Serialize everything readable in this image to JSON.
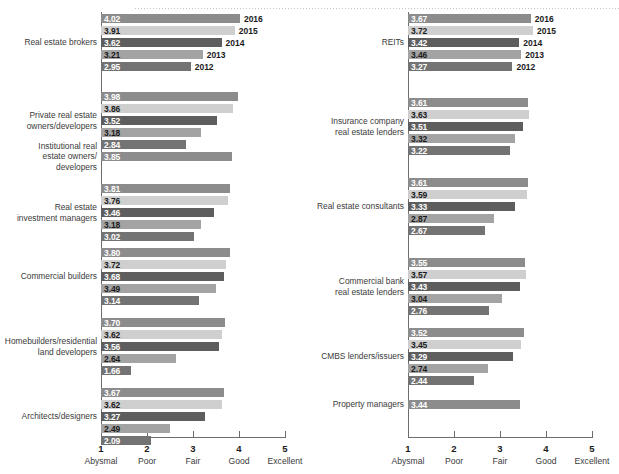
{
  "chart_data": {
    "type": "bar",
    "orientation": "horizontal",
    "title": "",
    "subtitle": "",
    "xlabel": "",
    "ylabel": "",
    "xlim": [
      1,
      5
    ],
    "grid": false,
    "legend_position": "inline-right-of-first-group",
    "axis": {
      "tick_values": [
        1,
        2,
        3,
        4,
        5
      ],
      "tick_labels": [
        "1",
        "2",
        "3",
        "4",
        "5"
      ],
      "tick_words": [
        "Abysmal",
        "Poor",
        "Fair",
        "Good",
        "Excellent"
      ]
    },
    "series": [
      {
        "name": "2016",
        "color": "#8c8c8c",
        "text_on": "dark"
      },
      {
        "name": "2015",
        "color": "#cfcfcf",
        "text_on": "light"
      },
      {
        "name": "2014",
        "color": "#5e5e5e",
        "text_on": "dark"
      },
      {
        "name": "2013",
        "color": "#a3a3a3",
        "text_on": "light"
      },
      {
        "name": "2012",
        "color": "#737373",
        "text_on": "dark"
      }
    ],
    "panels": [
      {
        "id": "left",
        "groups": [
          {
            "label": "Real estate brokers",
            "values": [
              4.02,
              3.91,
              3.62,
              3.21,
              2.95
            ],
            "value_labels": [
              "4.02",
              "3.91",
              "3.62",
              "3.21",
              "2.95"
            ],
            "show_year_labels": true
          },
          {
            "label": "Private real estate\nowners/developers",
            "values": [
              3.98,
              3.86,
              3.52,
              3.18,
              2.84
            ],
            "value_labels": [
              "3.98",
              "3.86",
              "3.52",
              "3.18",
              "2.84"
            ],
            "show_year_labels": false
          },
          {
            "label": "Institutional real\nestate owners/\ndevelopers",
            "values": [
              3.85
            ],
            "value_labels": [
              "3.85"
            ],
            "show_year_labels": false
          },
          {
            "label": "Real estate\ninvestment managers",
            "values": [
              3.81,
              3.76,
              3.46,
              3.18,
              3.02
            ],
            "value_labels": [
              "3.81",
              "3.76",
              "3.46",
              "3.18",
              "3.02"
            ],
            "show_year_labels": false
          },
          {
            "label": "Commercial builders",
            "values": [
              3.8,
              3.72,
              3.68,
              3.49,
              3.14
            ],
            "value_labels": [
              "3.80",
              "3.72",
              "3.68",
              "3.49",
              "3.14"
            ],
            "show_year_labels": false
          },
          {
            "label": "Homebuilders/residential\nland developers",
            "values": [
              3.7,
              3.62,
              3.56,
              2.64,
              1.66
            ],
            "value_labels": [
              "3.70",
              "3.62",
              "3.56",
              "2.64",
              "1.66"
            ],
            "show_year_labels": false
          },
          {
            "label": "Architects/designers",
            "values": [
              3.67,
              3.62,
              3.27,
              2.49,
              2.09
            ],
            "value_labels": [
              "3.67",
              "3.62",
              "3.27",
              "2.49",
              "2.09"
            ],
            "show_year_labels": false
          }
        ]
      },
      {
        "id": "right",
        "groups": [
          {
            "label": "REITs",
            "values": [
              3.67,
              3.72,
              3.42,
              3.46,
              3.27
            ],
            "value_labels": [
              "3.67",
              "3.72",
              "3.42",
              "3.46",
              "3.27"
            ],
            "show_year_labels": true
          },
          {
            "label": "Insurance company\nreal estate lenders",
            "values": [
              3.61,
              3.63,
              3.51,
              3.32,
              3.22
            ],
            "value_labels": [
              "3.61",
              "3.63",
              "3.51",
              "3.32",
              "3.22"
            ],
            "show_year_labels": false
          },
          {
            "label": "Real estate consultants",
            "values": [
              3.61,
              3.59,
              3.33,
              2.87,
              2.67
            ],
            "value_labels": [
              "3.61",
              "3.59",
              "3.33",
              "2.87",
              "2.67"
            ],
            "show_year_labels": false
          },
          {
            "label": "Commercial bank\nreal estate lenders",
            "values": [
              3.55,
              3.57,
              3.43,
              3.04,
              2.76
            ],
            "value_labels": [
              "3.55",
              "3.57",
              "3.43",
              "3.04",
              "2.76"
            ],
            "show_year_labels": false
          },
          {
            "label": "CMBS lenders/issuers",
            "values": [
              3.52,
              3.45,
              3.29,
              2.74,
              2.44
            ],
            "value_labels": [
              "3.52",
              "3.45",
              "3.29",
              "2.74",
              "2.44"
            ],
            "show_year_labels": false
          },
          {
            "label": "Property managers",
            "values": [
              3.44
            ],
            "value_labels": [
              "3.44"
            ],
            "show_year_labels": false
          }
        ]
      }
    ]
  }
}
